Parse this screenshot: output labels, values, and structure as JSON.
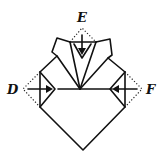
{
  "diagram": {
    "type": "origami-fold-step",
    "labels": [
      {
        "id": "E",
        "text": "E",
        "position": "top"
      },
      {
        "id": "D",
        "text": "D",
        "position": "left"
      },
      {
        "id": "F",
        "text": "F",
        "position": "right"
      }
    ],
    "arrows": [
      {
        "from": "E",
        "direction": "down"
      },
      {
        "from": "D",
        "direction": "right"
      },
      {
        "from": "F",
        "direction": "left"
      }
    ],
    "colors": {
      "ink": "#111111",
      "background": "#ffffff"
    }
  }
}
